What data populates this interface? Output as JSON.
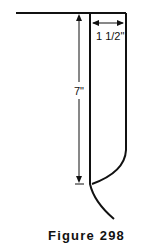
{
  "figure": {
    "caption": "Figure 298",
    "dimensions": {
      "height_label": "7\"",
      "width_label": "1 1/2\""
    },
    "colors": {
      "line": "#111111",
      "background": "#ffffff"
    }
  }
}
